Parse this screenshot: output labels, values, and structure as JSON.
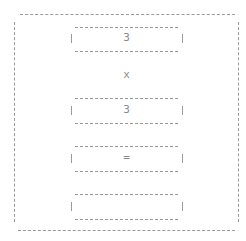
{
  "calculator": {
    "operand_a": "3",
    "operator": "x",
    "operand_b": "3",
    "equals_label": "=",
    "result": ""
  },
  "colors": {
    "text": "#8a8a8a",
    "border": "#9a9a9a",
    "background": "#ffffff"
  }
}
